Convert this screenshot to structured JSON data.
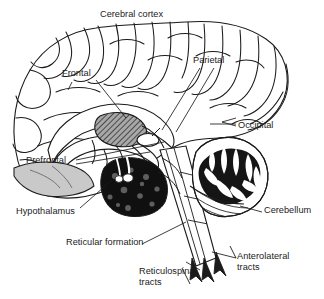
{
  "figure": {
    "type": "anatomical-illustration",
    "view": "mid-sagittal section",
    "background_color": "#ffffff",
    "ink_color": "#1b1b1b",
    "shading": {
      "thalamus_hatch": "#8a8a8a",
      "reticular_mass": "#111111",
      "orbital_gray": "#c9c9c9",
      "cerebellum_dark": "#151515"
    }
  },
  "labels": {
    "cerebral_cortex": "Cerebral cortex",
    "frontal": "Frontal",
    "parietal": "Parietal",
    "occipital": "Occipital",
    "prefrontal": "Prefrontal",
    "hypothalamus": "Hypothalamus",
    "cerebellum": "Cerebellum",
    "reticular_formation": "Reticular formation",
    "reticulospinal_tracts": "Reticulospinal\ntracts",
    "anterolateral_tracts": "Anterolateral\ntracts"
  },
  "structures": [
    {
      "name": "cerebral-cortex",
      "label": "Cerebral cortex",
      "shading": "outline"
    },
    {
      "name": "frontal-lobe",
      "label": "Frontal",
      "shading": "outline"
    },
    {
      "name": "parietal-lobe",
      "label": "Parietal",
      "shading": "outline"
    },
    {
      "name": "occipital-lobe",
      "label": "Occipital",
      "shading": "outline"
    },
    {
      "name": "prefrontal-cortex",
      "label": "Prefrontal",
      "shading": "light-gray"
    },
    {
      "name": "thalamus",
      "label": "",
      "shading": "hatched-gray"
    },
    {
      "name": "hypothalamus",
      "label": "Hypothalamus",
      "shading": "black"
    },
    {
      "name": "reticular-formation",
      "label": "Reticular formation",
      "shading": "black-stippled"
    },
    {
      "name": "cerebellum",
      "label": "Cerebellum",
      "shading": "arbor-vitae-striated"
    },
    {
      "name": "brainstem",
      "label": "",
      "shading": "outline"
    },
    {
      "name": "reticulospinal-tracts",
      "label": "Reticulospinal tracts",
      "shading": "arrows"
    },
    {
      "name": "anterolateral-tracts",
      "label": "Anterolateral tracts",
      "shading": "arrows"
    }
  ]
}
